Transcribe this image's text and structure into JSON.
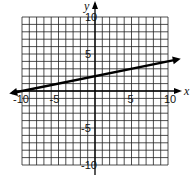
{
  "chart_data": {
    "type": "line",
    "title": "",
    "xlabel": "x",
    "ylabel": "y",
    "xlim": [
      -10,
      10
    ],
    "ylim": [
      -10,
      10
    ],
    "grid": true,
    "x_ticks": [
      "-10",
      "-5",
      "5",
      "10"
    ],
    "y_ticks": [
      "10",
      "5",
      "-5",
      "-10"
    ],
    "series": [
      {
        "name": "line",
        "equation": "y = x/5 + 2",
        "x": [
          -10,
          10
        ],
        "y": [
          0,
          4
        ],
        "arrows": "both"
      }
    ]
  }
}
